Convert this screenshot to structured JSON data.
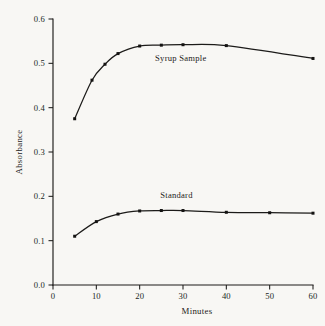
{
  "chart_data": {
    "type": "line",
    "title": "",
    "subtitle": "",
    "xlabel": "Minutes",
    "ylabel": "Absorbance",
    "xlim": [
      0,
      60
    ],
    "ylim": [
      0.0,
      0.6
    ],
    "xticks": [
      0,
      10,
      20,
      30,
      40,
      50,
      60
    ],
    "xticklabels": [
      "0",
      "10",
      "20",
      "30",
      "40",
      "50",
      "60"
    ],
    "yticks": [
      0.0,
      0.1,
      0.2,
      0.3,
      0.4,
      0.5,
      0.6
    ],
    "yticklabels": [
      "0.0",
      "0.1",
      "0.2",
      "0.3",
      "0.4",
      "0.5",
      "0.6"
    ],
    "grid": false,
    "legend_position": "inline-annotation",
    "marker": "square",
    "series": [
      {
        "name": "Syrup Sample",
        "label_x": 29.5,
        "label_y": 0.505,
        "x": [
          5,
          9,
          12,
          15,
          20,
          25,
          30,
          40,
          60
        ],
        "y": [
          0.375,
          0.462,
          0.498,
          0.522,
          0.539,
          0.541,
          0.542,
          0.54,
          0.511
        ]
      },
      {
        "name": "Standard",
        "label_x": 28.5,
        "label_y": 0.196,
        "x": [
          5,
          10,
          15,
          20,
          25,
          30,
          40,
          50,
          60
        ],
        "y": [
          0.11,
          0.143,
          0.16,
          0.167,
          0.168,
          0.168,
          0.164,
          0.163,
          0.162
        ]
      }
    ]
  },
  "figure": {
    "background_color": "#f8f7f4",
    "ink_color": "#1c1b19"
  }
}
